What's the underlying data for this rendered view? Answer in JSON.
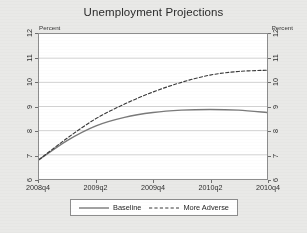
{
  "figure": {
    "title": "Unemployment Projections",
    "background_color": "#e9e9e7",
    "plot_background_color": "#ffffff",
    "frame_color": "#8d8d8d"
  },
  "axes": {
    "y_unit_label_left": "Percent",
    "y_unit_label_right": "Percent",
    "y_ticks": [
      "6",
      "7",
      "8",
      "9",
      "10",
      "11",
      "12"
    ],
    "x_ticks": [
      "2008q4",
      "2009q2",
      "2009q4",
      "2010q2",
      "2010q4"
    ]
  },
  "legend": {
    "items": [
      {
        "label": "Baseline",
        "style": "solid",
        "color": "#7a7a7a"
      },
      {
        "label": "More Adverse",
        "style": "dashed",
        "color": "#3a3a3a"
      }
    ]
  },
  "chart_data": {
    "type": "line",
    "title": "Unemployment Projections",
    "xlabel": "",
    "ylabel": "Percent",
    "ylim": [
      6,
      12
    ],
    "xlim": [
      "2008q4",
      "2010q4"
    ],
    "grid": true,
    "grid_orientation": "horizontal",
    "legend_position": "below-plot",
    "y_tick_values": [
      6,
      7,
      8,
      9,
      10,
      11,
      12
    ],
    "y_axis_both_sides": true,
    "x": [
      "2008q4",
      "2009q1",
      "2009q2",
      "2009q3",
      "2009q4",
      "2010q1",
      "2010q2",
      "2010q3",
      "2010q4"
    ],
    "series": [
      {
        "name": "Baseline",
        "style": "solid",
        "color": "#7a7a7a",
        "values": [
          6.8,
          7.6,
          8.2,
          8.55,
          8.75,
          8.85,
          8.88,
          8.85,
          8.75
        ]
      },
      {
        "name": "More Adverse",
        "style": "dashed",
        "color": "#3a3a3a",
        "values": [
          6.8,
          7.7,
          8.5,
          9.1,
          9.6,
          10.0,
          10.3,
          10.45,
          10.5
        ]
      }
    ]
  }
}
